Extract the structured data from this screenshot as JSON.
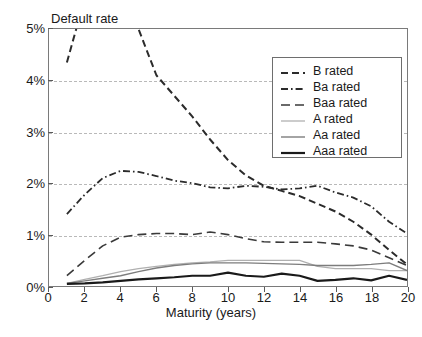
{
  "top_cropped_text": "",
  "chart_data": {
    "type": "line",
    "title": "",
    "ylabel": "Default rate",
    "xlabel": "Maturity (years)",
    "xlim": [
      0,
      20
    ],
    "ylim": [
      0,
      5
    ],
    "yunit": "%",
    "grid": true,
    "legend_position": "upper-right",
    "ytick_labels": [
      "0%",
      "1%",
      "2%",
      "3%",
      "4%",
      "5%"
    ],
    "ytick_values": [
      0,
      1,
      2,
      3,
      4,
      5
    ],
    "xtick_labels": [
      "0",
      "2",
      "4",
      "6",
      "8",
      "10",
      "12",
      "14",
      "16",
      "18",
      "20"
    ],
    "xtick_values": [
      0,
      2,
      4,
      6,
      8,
      10,
      12,
      14,
      16,
      18,
      20
    ],
    "x": [
      1,
      2,
      3,
      4,
      5,
      6,
      7,
      8,
      9,
      10,
      11,
      12,
      13,
      14,
      15,
      16,
      17,
      18,
      19,
      20
    ],
    "series": [
      {
        "name": "B rated",
        "style": "dashed",
        "color": "#2b2b2b",
        "width": 2.0,
        "clipped_above_axis": true,
        "values": [
          4.35,
          5.6,
          6.2,
          5.65,
          5.0,
          4.1,
          3.7,
          3.3,
          2.85,
          2.45,
          2.15,
          1.95,
          1.85,
          1.75,
          1.6,
          1.45,
          1.25,
          1.0,
          0.7,
          0.42
        ]
      },
      {
        "name": "Ba rated",
        "style": "dash-dot",
        "color": "#2b2b2b",
        "width": 1.8,
        "values": [
          1.4,
          1.78,
          2.1,
          2.24,
          2.22,
          2.14,
          2.05,
          2.0,
          1.92,
          1.9,
          1.95,
          1.93,
          1.88,
          1.9,
          1.95,
          1.82,
          1.72,
          1.55,
          1.25,
          1.02
        ]
      },
      {
        "name": "Baa rated",
        "style": "long-dash",
        "color": "#3a3a3a",
        "width": 1.6,
        "values": [
          0.2,
          0.5,
          0.78,
          0.95,
          1.0,
          1.02,
          1.02,
          1.0,
          1.05,
          1.0,
          0.92,
          0.86,
          0.85,
          0.85,
          0.85,
          0.82,
          0.78,
          0.7,
          0.55,
          0.4
        ]
      },
      {
        "name": "A rated",
        "style": "solid",
        "color": "#b0b0b0",
        "width": 1.3,
        "values": [
          0.05,
          0.13,
          0.2,
          0.28,
          0.34,
          0.38,
          0.42,
          0.45,
          0.47,
          0.5,
          0.5,
          0.5,
          0.5,
          0.5,
          0.38,
          0.34,
          0.34,
          0.34,
          0.3,
          0.3
        ]
      },
      {
        "name": "Aa rated",
        "style": "solid",
        "color": "#7d7d7d",
        "width": 1.4,
        "values": [
          0.05,
          0.1,
          0.15,
          0.2,
          0.28,
          0.35,
          0.4,
          0.43,
          0.45,
          0.45,
          0.45,
          0.44,
          0.43,
          0.42,
          0.4,
          0.4,
          0.4,
          0.42,
          0.45,
          0.3
        ]
      },
      {
        "name": "Aaa rated",
        "style": "solid",
        "color": "#1a1a1a",
        "width": 2.2,
        "values": [
          0.04,
          0.05,
          0.07,
          0.1,
          0.13,
          0.15,
          0.17,
          0.2,
          0.2,
          0.26,
          0.2,
          0.18,
          0.24,
          0.2,
          0.1,
          0.12,
          0.15,
          0.11,
          0.2,
          0.12
        ]
      }
    ]
  }
}
